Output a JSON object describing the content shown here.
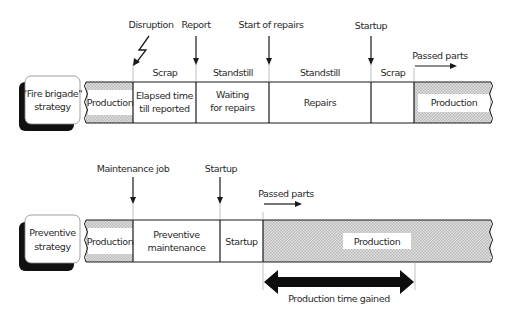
{
  "top": {
    "strategy_label_line1": "\"Fire brigade\"",
    "strategy_label_line2": "strategy",
    "events": {
      "disruption": "Disruption",
      "report": "Report",
      "start_of_repairs": "Start of repairs",
      "startup": "Startup",
      "passed_parts": "Passed parts"
    },
    "phase_labels": {
      "scrap1": "Scrap",
      "standstill1": "Standstill",
      "standstill2": "Standstill",
      "scrap2": "Scrap"
    },
    "segments": {
      "production_start": "Production",
      "elapsed_line1": "Elapsed time",
      "elapsed_line2": "till reported",
      "waiting_line1": "Waiting",
      "waiting_line2": "for repairs",
      "repairs": "Repairs",
      "production_end": "Production"
    }
  },
  "bottom": {
    "strategy_label_line1": "Preventive",
    "strategy_label_line2": "strategy",
    "events": {
      "maintenance_job": "Maintenance job",
      "startup": "Startup",
      "passed_parts": "Passed parts"
    },
    "segments": {
      "production_start": "Production",
      "preventive_line1": "Preventive",
      "preventive_line2": "maintenance",
      "startup": "Startup",
      "production_end": "Production"
    },
    "gain_label": "Production time gained"
  },
  "colors": {
    "line": "#1a1a1a",
    "hatch": "#c8c8c8",
    "text": "#2a2a2a"
  }
}
